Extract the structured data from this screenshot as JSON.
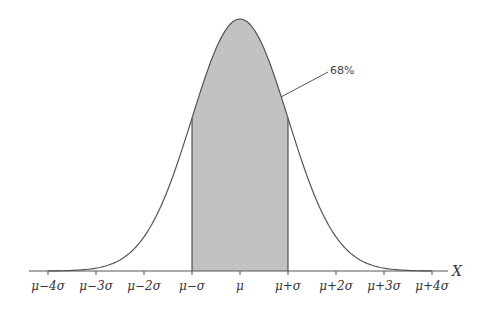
{
  "chart_data": {
    "type": "area",
    "title": "",
    "subtitle": "",
    "xlabel": "X",
    "ylabel": "",
    "x_ticks": [
      "μ−4σ",
      "μ−3σ",
      "μ−2σ",
      "μ−σ",
      "μ",
      "μ+σ",
      "μ+2σ",
      "μ+3σ",
      "μ+4σ"
    ],
    "x_tick_values": [
      -4,
      -3,
      -2,
      -1,
      0,
      1,
      2,
      3,
      4
    ],
    "xlim": [
      -4.4,
      4.4
    ],
    "grid": false,
    "legend": null,
    "series": [
      {
        "name": "Normal density",
        "function": "standard normal pdf",
        "x": [
          -4,
          -3.5,
          -3,
          -2.5,
          -2,
          -1.5,
          -1,
          -0.5,
          0,
          0.5,
          1,
          1.5,
          2,
          2.5,
          3,
          3.5,
          4
        ],
        "relative_height": [
          0.0003,
          0.0022,
          0.0111,
          0.0439,
          0.1353,
          0.3247,
          0.6065,
          0.8825,
          1.0,
          0.8825,
          0.6065,
          0.3247,
          0.1353,
          0.0439,
          0.0111,
          0.0022,
          0.0003
        ]
      }
    ],
    "shaded_region": {
      "from": -1,
      "to": 1,
      "color": "#c2c2c2"
    },
    "annotations": [
      {
        "text": "68%",
        "points_to": "shaded region right edge near x = μ+σ·0.85"
      }
    ],
    "colors": {
      "curve": "#555555",
      "fill": "#c2c2c2",
      "axis": "#555555",
      "text": "#333333"
    }
  },
  "labels": {
    "ticks": [
      "μ−4σ",
      "μ−3σ",
      "μ−2σ",
      "μ−σ",
      "μ",
      "μ+σ",
      "μ+2σ",
      "μ+3σ",
      "μ+4σ"
    ],
    "axis_var": "X",
    "annotation": "68%"
  }
}
